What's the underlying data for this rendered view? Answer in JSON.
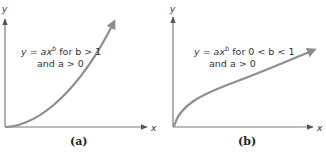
{
  "panels": [
    {
      "id": "a",
      "caption": "(a)",
      "x_label": "x",
      "y_label": "y",
      "equation_line1_prefix": "y = ax",
      "equation_exponent": "b",
      "equation_line1_suffix": " for b > 1",
      "equation_line2": "and a > 0",
      "curve_shape": "convex (b > 1)"
    },
    {
      "id": "b",
      "caption": "(b)",
      "x_label": "x",
      "y_label": "y",
      "equation_line1_prefix": "y = ax",
      "equation_exponent": "b",
      "equation_line1_suffix": " for 0 < b < 1",
      "equation_line2": "and a > 0",
      "curve_shape": "concave (0 < b < 1)"
    }
  ],
  "colors": {
    "axis": "#7a7a7a",
    "curve": "#8e8e8e",
    "text": "#333333"
  }
}
